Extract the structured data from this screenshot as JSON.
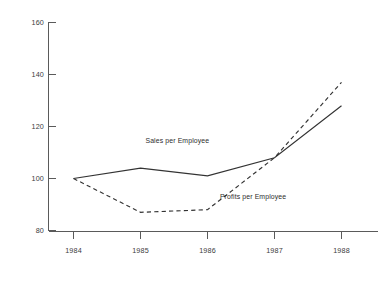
{
  "chart_data": {
    "type": "line",
    "title": "",
    "subtitle": "",
    "xlabel": "",
    "ylabel": "",
    "categories": [
      "1984",
      "1985",
      "1986",
      "1987",
      "1988"
    ],
    "x": [
      1984,
      1985,
      1986,
      1987,
      1988
    ],
    "xlim": [
      1984,
      1988
    ],
    "ylim": [
      80,
      160
    ],
    "yticks": [
      80,
      100,
      120,
      140,
      160
    ],
    "xticks": [
      "1984",
      "1985",
      "1986",
      "1987",
      "1988"
    ],
    "grid": false,
    "legend_position": "inline-annotation",
    "series": [
      {
        "name": "Sales per Employee",
        "style": "solid",
        "color": "#333333",
        "values": [
          100,
          104,
          101,
          108,
          128
        ],
        "annotation": {
          "text": "Sales per Employee",
          "x": 1985.55,
          "y": 113.5
        }
      },
      {
        "name": "Profits per Employee",
        "style": "dashed",
        "color": "#333333",
        "values": [
          100,
          87,
          88,
          108,
          137
        ],
        "annotation": {
          "text": "Profits per Employee",
          "x": 1986.68,
          "y": 92.0
        }
      }
    ]
  },
  "axes": {
    "y_tick_labels": [
      "160",
      "140",
      "120",
      "100",
      "80"
    ],
    "x_tick_labels": [
      "1984",
      "1985",
      "1986",
      "1987",
      "1988"
    ],
    "axis_color": "#5a5a5a"
  }
}
